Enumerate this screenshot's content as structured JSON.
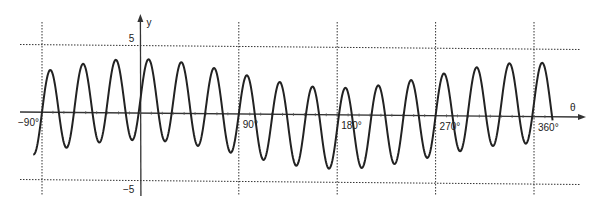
{
  "chart_data": {
    "type": "line",
    "title": "",
    "xlabel": "θ",
    "ylabel": "y",
    "x_unit": "degrees",
    "xlim": [
      -100,
      380
    ],
    "ylim": [
      -6,
      6
    ],
    "grid": "dotted reference lines",
    "x_ticks": [
      {
        "value": -90,
        "label": "−90°"
      },
      {
        "value": 90,
        "label": "90°"
      },
      {
        "value": 180,
        "label": "180°"
      },
      {
        "value": 270,
        "label": "270°"
      },
      {
        "value": 360,
        "label": "360°"
      }
    ],
    "y_ticks": [
      {
        "value": 5,
        "label": "5"
      },
      {
        "value": -5,
        "label": "−5"
      }
    ],
    "series": [
      {
        "name": "y = 3 sin 12θ + cos θ",
        "function": {
          "a": 3,
          "k": 12,
          "b": 1
        },
        "x_range": [
          -98,
          377
        ],
        "color": "#222222",
        "sampled_points": [
          [
            -90,
            0
          ],
          [
            0,
            1
          ],
          [
            7.5,
            4.0
          ],
          [
            22.5,
            -2.1
          ],
          [
            90,
            0
          ],
          [
            180,
            -1
          ],
          [
            187.5,
            2.0
          ],
          [
            202.5,
            -4.0
          ],
          [
            270,
            0
          ],
          [
            360,
            1
          ],
          [
            367.5,
            4.0
          ]
        ]
      }
    ],
    "legend": "none"
  }
}
